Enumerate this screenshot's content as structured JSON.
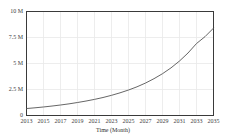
{
  "chart_data": {
    "type": "line",
    "title": "",
    "xlabel": "Time (Month)",
    "ylabel": "",
    "xlim": [
      2013,
      2035
    ],
    "ylim": [
      0,
      10000000
    ],
    "grid": true,
    "legend": "none",
    "x_tick_labels": [
      "2013",
      "2015",
      "2017",
      "2019",
      "2021",
      "2023",
      "2025",
      "2027",
      "2029",
      "2031",
      "2033",
      "2035"
    ],
    "x_tick_values": [
      2013,
      2015,
      2017,
      2019,
      2021,
      2023,
      2025,
      2027,
      2029,
      2031,
      2033,
      2035
    ],
    "y_tick_labels": [
      "0",
      "2.5 M",
      "5 M",
      "7.5 M",
      "10 M"
    ],
    "y_tick_values": [
      0,
      2500000,
      5000000,
      7500000,
      10000000
    ],
    "series": [
      {
        "name": "growth",
        "color": "#555555",
        "x": [
          2013,
          2014,
          2015,
          2016,
          2017,
          2018,
          2019,
          2020,
          2021,
          2022,
          2023,
          2024,
          2025,
          2026,
          2027,
          2028,
          2029,
          2030,
          2031,
          2032,
          2033,
          2034,
          2035
        ],
        "values": [
          670000,
          740000,
          820000,
          910000,
          1010000,
          1120000,
          1250000,
          1390000,
          1550000,
          1730000,
          1940000,
          2180000,
          2450000,
          2760000,
          3120000,
          3540000,
          4020000,
          4580000,
          5240000,
          6010000,
          6920000,
          7580000,
          8400000
        ]
      }
    ],
    "colors": {
      "line": "#555555",
      "axis": "#3a3a3a",
      "grid": "#e8e8e8",
      "text": "#404040",
      "background": "#ffffff"
    }
  },
  "axis_title": {
    "x": "Time (Month)"
  }
}
